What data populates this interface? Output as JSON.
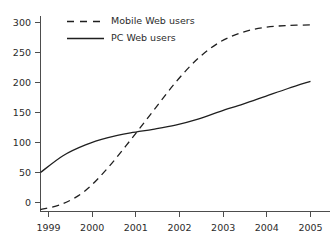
{
  "chart_data": {
    "type": "line",
    "title": "",
    "subtitle": "",
    "xlabel": "",
    "ylabel": "",
    "xlim": [
      1998.7,
      2005.2
    ],
    "ylim": [
      -25,
      310
    ],
    "grid": false,
    "legend_position": "top-left",
    "x_tick_labels": [
      "1999",
      "2000",
      "2001",
      "2002",
      "2003",
      "2004",
      "2005"
    ],
    "x_ticks": [
      1999,
      2000,
      2001,
      2002,
      2003,
      2004,
      2005
    ],
    "y_tick_labels": [
      "0",
      "50",
      "100",
      "150",
      "200",
      "250",
      "300"
    ],
    "y_ticks": [
      0,
      50,
      100,
      150,
      200,
      250,
      300
    ],
    "x": [
      1999,
      1999.5,
      2000,
      2000.5,
      2001,
      2001.5,
      2002,
      2002.5,
      2003,
      2003.5,
      2004,
      2004.5,
      2005
    ],
    "series": [
      {
        "name": "Mobile Web users",
        "style": "dashed",
        "color": "#1f1f1f",
        "values": [
          -12,
          -2,
          20,
          58,
          104,
          152,
          200,
          240,
          268,
          284,
          292,
          295,
          296
        ]
      },
      {
        "name": "PC Web users",
        "style": "solid",
        "color": "#1f1f1f",
        "values": [
          50,
          78,
          96,
          108,
          116,
          122,
          129,
          139,
          152,
          164,
          177,
          190,
          202
        ]
      }
    ],
    "legend": [
      {
        "label": "Mobile Web users",
        "style": "dashed",
        "color": "#1f1f1f"
      },
      {
        "label": "PC Web users",
        "style": "solid",
        "color": "#1f1f1f"
      }
    ],
    "annotations": [
      {
        "text": "curves cross near 2001.4 at about 120"
      }
    ]
  },
  "figure": {
    "background_color": "#ffffff",
    "axis_color": "#4d4d4d",
    "text_color": "#2b2b2b"
  }
}
